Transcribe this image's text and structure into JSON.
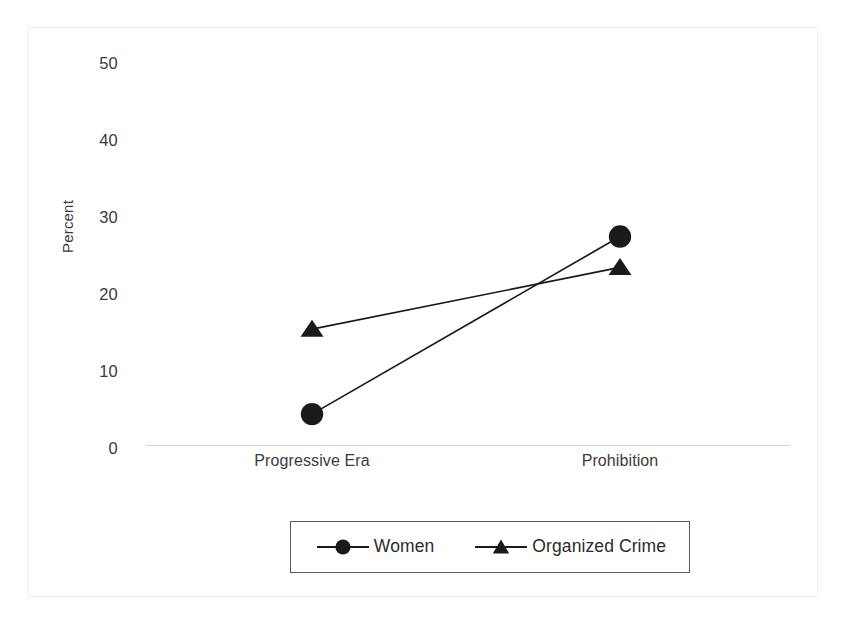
{
  "chart_data": {
    "type": "line",
    "title": "",
    "subtitle": "",
    "xlabel": "",
    "ylabel": "Percent",
    "categories": [
      "Progressive Era",
      "Prohibition"
    ],
    "series": [
      {
        "name": "Women",
        "marker": "circle",
        "values": [
          4,
          27
        ]
      },
      {
        "name": "Organized Crime",
        "marker": "triangle",
        "values": [
          15,
          23
        ]
      }
    ],
    "yticks": [
      "0",
      "10",
      "20",
      "30",
      "40",
      "50"
    ],
    "ylim": [
      0,
      50
    ],
    "grid": false,
    "legend_position": "bottom",
    "colors": {
      "series": "#1a1a1a",
      "axis": "#d6d6d6",
      "text": "#3b3b3b",
      "frame": "#efefef",
      "legend_border": "#5c5c5c"
    }
  },
  "axis": {
    "y_title": "Percent",
    "y_tick_labels": [
      "50",
      "40",
      "30",
      "20",
      "10",
      "0"
    ],
    "x_tick_labels": [
      "Progressive Era",
      "Prohibition"
    ]
  },
  "legend": {
    "entries": [
      {
        "label": "Women",
        "marker": "circle"
      },
      {
        "label": "Organized Crime",
        "marker": "triangle"
      }
    ]
  }
}
